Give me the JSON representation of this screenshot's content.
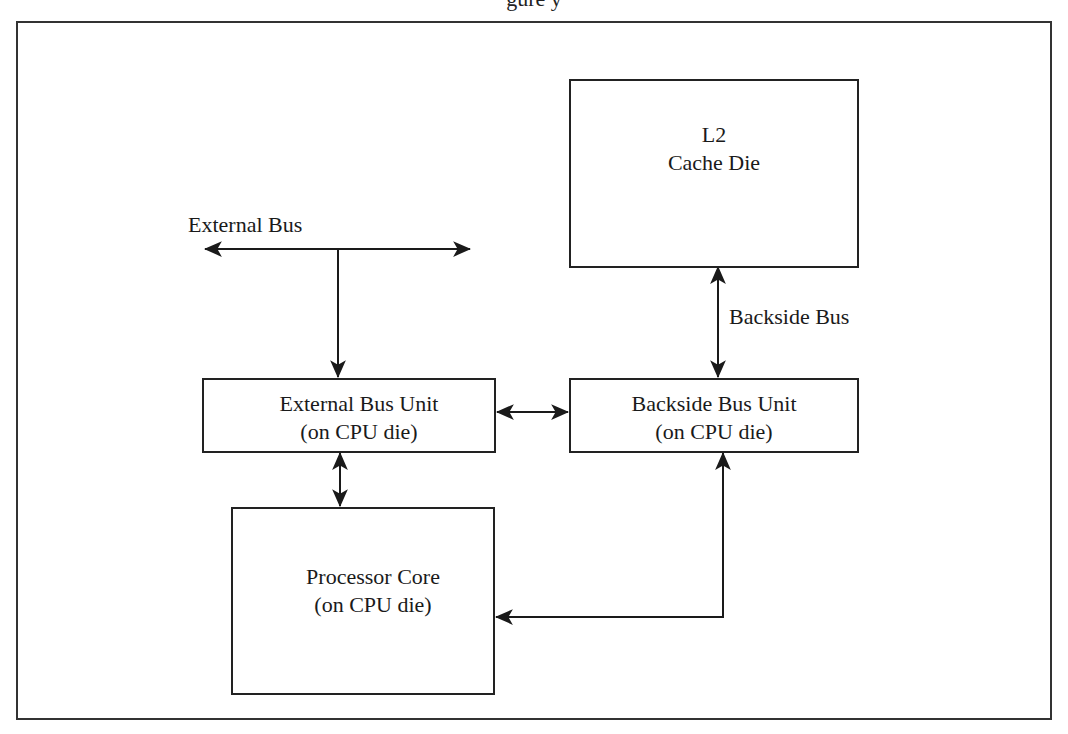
{
  "caption_fragment": "gure                                                          y",
  "labels": {
    "external_bus": "External Bus",
    "backside_bus": "Backside Bus"
  },
  "boxes": {
    "l2_cache": {
      "line1": "L2",
      "line2": "Cache Die"
    },
    "external_bus_unit": {
      "line1": "External Bus Unit",
      "line2": "(on CPU die)"
    },
    "backside_bus_unit": {
      "line1": "Backside Bus Unit",
      "line2": "(on CPU die)"
    },
    "processor_core": {
      "line1": "Processor Core",
      "line2": "(on CPU die)"
    }
  },
  "connections": [
    {
      "from": "external_bus",
      "to": "external_bus_unit",
      "direction": "one-way-down"
    },
    {
      "from": "l2_cache",
      "to": "backside_bus_unit",
      "via": "backside_bus",
      "direction": "bidirectional"
    },
    {
      "from": "external_bus_unit",
      "to": "backside_bus_unit",
      "direction": "bidirectional"
    },
    {
      "from": "external_bus_unit",
      "to": "processor_core",
      "direction": "bidirectional"
    },
    {
      "from": "processor_core",
      "to": "backside_bus_unit",
      "direction": "bidirectional"
    }
  ],
  "colors": {
    "line": "#1a1a1a",
    "frame": "#333333",
    "background": "#ffffff"
  }
}
